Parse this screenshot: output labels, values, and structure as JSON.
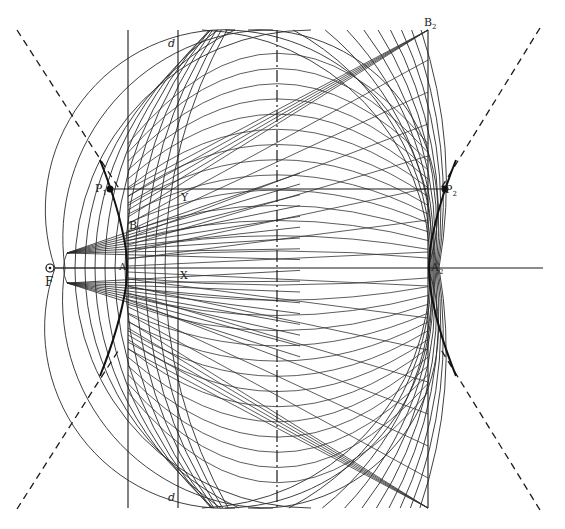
{
  "figure": {
    "type": "geometric-construction",
    "stroke_color": "#2a2a2a",
    "background": "#ffffff"
  },
  "labels": {
    "F": "F",
    "focus_symbol": "⊙",
    "P1": "P",
    "P1_sub": "1",
    "P2": "P",
    "P2_sub": "2",
    "B1": "B",
    "B1_sub": "1",
    "B2": "B",
    "B2_sub": "2",
    "A1": "A",
    "A2": "A",
    "A2_sub": "2",
    "X": "X",
    "Y": "Y",
    "d_top": "d",
    "d_bottom": "d"
  },
  "geometry": {
    "vertical_lines": [
      {
        "name": "line-A1-B1",
        "x": 128,
        "y1": 30,
        "y2": 508,
        "style": "solid"
      },
      {
        "name": "line-d",
        "x": 178,
        "y1": 30,
        "y2": 508,
        "style": "solid"
      },
      {
        "name": "center-axis",
        "x": 277,
        "y1": 30,
        "y2": 508,
        "style": "dash-dot"
      },
      {
        "name": "line-B2",
        "x": 428,
        "y1": 30,
        "y2": 508,
        "style": "solid"
      }
    ],
    "horizontal_lines": [
      {
        "name": "line-P1-P2",
        "y": 189,
        "x1": 110,
        "x2": 445
      },
      {
        "name": "axis-F-A2",
        "y": 268,
        "x1": 55,
        "x2": 543
      }
    ],
    "asymptotes": [
      {
        "x1": 17,
        "y1": 30,
        "x2": 120,
        "y2": 190
      },
      {
        "x1": 17,
        "y1": 509,
        "x2": 120,
        "y2": 348
      },
      {
        "x1": 540,
        "y1": 28,
        "x2": 440,
        "y2": 190
      },
      {
        "x1": 540,
        "y1": 510,
        "x2": 440,
        "y2": 348
      }
    ],
    "focus": {
      "x": 50,
      "y": 268
    },
    "fan_source_top": {
      "x": 67,
      "y": 253
    },
    "fan_source_bottom": {
      "x": 67,
      "y": 283
    }
  }
}
